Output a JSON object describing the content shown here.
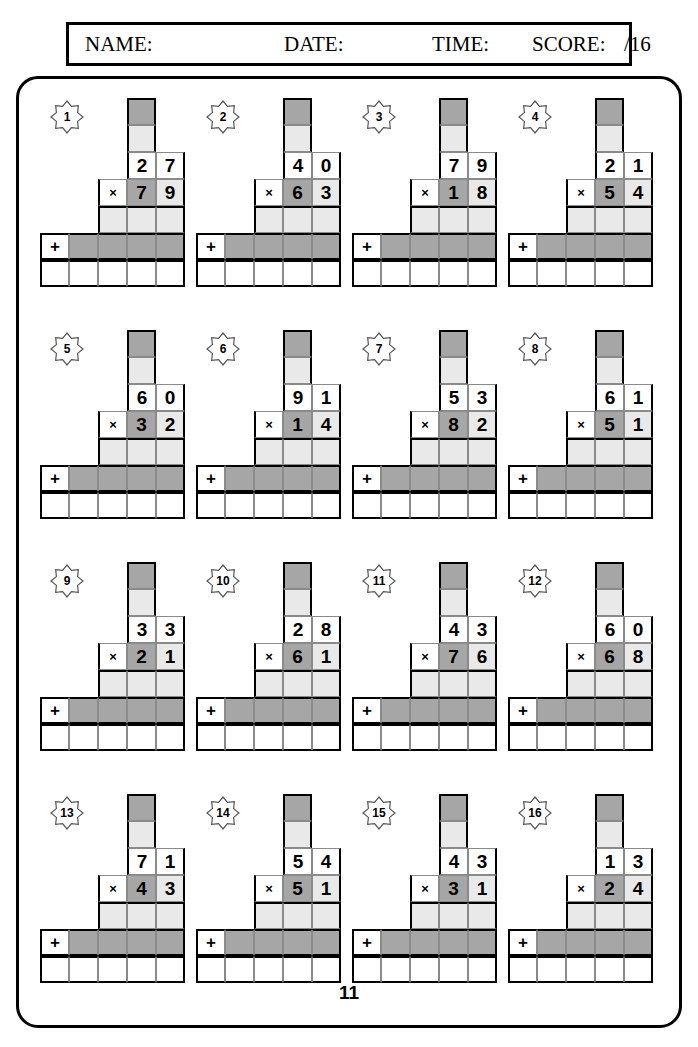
{
  "header": {
    "name_label": "NAME:",
    "date_label": "DATE:",
    "time_label": "TIME:",
    "score_label": "SCORE:",
    "score_total": "/16"
  },
  "page_number": "11",
  "operators": {
    "multiply": "×",
    "add": "+"
  },
  "colors": {
    "cell_light": "#e9e9e9",
    "cell_dark": "#a6a6a6",
    "border": "#000000"
  },
  "problems": [
    {
      "number": "1",
      "top": [
        "2",
        "7"
      ],
      "bottom": [
        "7",
        "9"
      ]
    },
    {
      "number": "2",
      "top": [
        "4",
        "0"
      ],
      "bottom": [
        "6",
        "3"
      ]
    },
    {
      "number": "3",
      "top": [
        "7",
        "9"
      ],
      "bottom": [
        "1",
        "8"
      ]
    },
    {
      "number": "4",
      "top": [
        "2",
        "1"
      ],
      "bottom": [
        "5",
        "4"
      ]
    },
    {
      "number": "5",
      "top": [
        "6",
        "0"
      ],
      "bottom": [
        "3",
        "2"
      ]
    },
    {
      "number": "6",
      "top": [
        "9",
        "1"
      ],
      "bottom": [
        "1",
        "4"
      ]
    },
    {
      "number": "7",
      "top": [
        "5",
        "3"
      ],
      "bottom": [
        "8",
        "2"
      ]
    },
    {
      "number": "8",
      "top": [
        "6",
        "1"
      ],
      "bottom": [
        "5",
        "1"
      ]
    },
    {
      "number": "9",
      "top": [
        "3",
        "3"
      ],
      "bottom": [
        "2",
        "1"
      ]
    },
    {
      "number": "10",
      "top": [
        "2",
        "8"
      ],
      "bottom": [
        "6",
        "1"
      ]
    },
    {
      "number": "11",
      "top": [
        "4",
        "3"
      ],
      "bottom": [
        "7",
        "6"
      ]
    },
    {
      "number": "12",
      "top": [
        "6",
        "0"
      ],
      "bottom": [
        "6",
        "8"
      ]
    },
    {
      "number": "13",
      "top": [
        "7",
        "1"
      ],
      "bottom": [
        "4",
        "3"
      ]
    },
    {
      "number": "14",
      "top": [
        "5",
        "4"
      ],
      "bottom": [
        "5",
        "1"
      ]
    },
    {
      "number": "15",
      "top": [
        "4",
        "3"
      ],
      "bottom": [
        "3",
        "1"
      ]
    },
    {
      "number": "16",
      "top": [
        "1",
        "3"
      ],
      "bottom": [
        "2",
        "4"
      ]
    }
  ]
}
